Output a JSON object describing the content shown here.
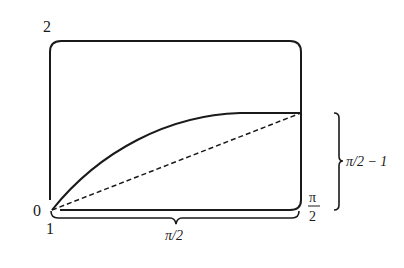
{
  "diagram": {
    "type": "geometric-schematic",
    "colors": {
      "stroke": "#1a1a1a",
      "background": "#ffffff"
    },
    "box": {
      "corner_labels": {
        "top_left": "2",
        "bottom_left": "0",
        "bottom_left_below": "1"
      }
    },
    "curve": {
      "style": "solid",
      "description": "concave curve from bottom-left corner rising to right edge"
    },
    "chord": {
      "style": "dashed",
      "description": "straight dashed line from bottom-left corner to end of curve"
    },
    "right_edge_label": {
      "numerator": "π",
      "denominator": "2"
    },
    "bottom_brace": {
      "label": "π/2"
    },
    "right_brace": {
      "label": "π/2 − 1"
    }
  }
}
